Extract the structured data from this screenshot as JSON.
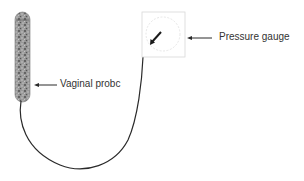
{
  "diagram": {
    "labels": {
      "probe": "Vaginal probc",
      "gauge": "Pressure gauge"
    },
    "colors": {
      "line": "#2a2a2a",
      "text": "#333333",
      "gauge_border": "#d8d8d8",
      "probe_fill": "#8a8a8a"
    }
  }
}
